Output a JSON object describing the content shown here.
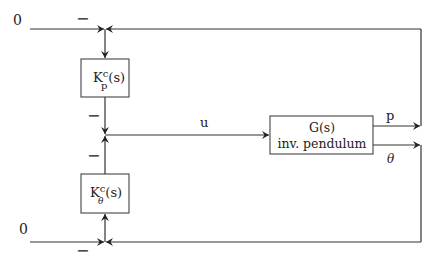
{
  "diagram": {
    "type": "block-diagram",
    "inputs": [
      {
        "id": "ref-top",
        "label": "0"
      },
      {
        "id": "ref-bottom",
        "label": "0"
      }
    ],
    "blocks": [
      {
        "id": "kp",
        "main": "K",
        "sup": "c",
        "sub": "p",
        "arg": "(s)"
      },
      {
        "id": "ktheta",
        "main": "K",
        "sup": "c",
        "sub": "θ",
        "arg": "(s)"
      },
      {
        "id": "plant",
        "line1": "G(s)",
        "line2": "inv. pendulum"
      }
    ],
    "signals": {
      "control": "u",
      "output_position": "p",
      "output_angle": "θ"
    },
    "signs": {
      "top_sum_minus": "−",
      "mid_sum_top_minus": "−",
      "mid_sum_bottom_minus": "−",
      "bottom_sum_minus": "−"
    },
    "colors": {
      "stroke": "#333333",
      "background": "#ffffff"
    }
  }
}
